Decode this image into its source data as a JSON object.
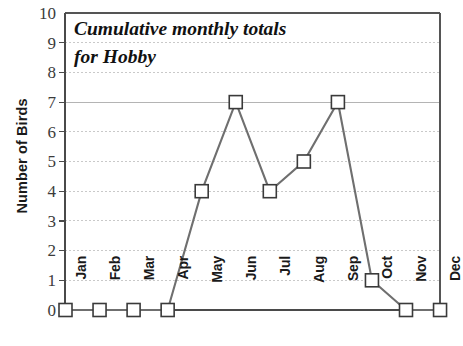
{
  "chart_data": {
    "type": "line",
    "title": "Cumulative monthly totals for Hobby",
    "title_line1": "Cumulative monthly totals",
    "title_line2": "for Hobby",
    "xlabel": "",
    "ylabel": "Number of Birds",
    "categories": [
      "Jan",
      "Feb",
      "Mar",
      "Apr",
      "May",
      "Jun",
      "Jul",
      "Aug",
      "Sep",
      "Oct",
      "Nov",
      "Dec"
    ],
    "values": [
      0,
      0,
      0,
      0,
      4,
      7,
      4,
      5,
      7,
      1,
      0,
      0
    ],
    "series": [
      {
        "name": "Hobby",
        "values": [
          0,
          0,
          0,
          0,
          4,
          7,
          4,
          5,
          7,
          1,
          0,
          0
        ]
      }
    ],
    "ylim": [
      0,
      10
    ],
    "y_ticks": [
      0,
      1,
      2,
      3,
      4,
      5,
      6,
      7,
      8,
      9,
      10
    ],
    "y_tick_labels": [
      "0",
      "1",
      "2",
      "3",
      "4",
      "5",
      "6",
      "7",
      "8",
      "9",
      "10"
    ],
    "grid": true,
    "grid_axis": "y",
    "legend": "none",
    "marker": "open-square",
    "line_color": "#6f6f6f",
    "marker_edge_color": "#3a3a3a",
    "marker_face_color": "#ffffff",
    "grid_color": "#c9c9c9",
    "axis_color": "#555555",
    "text_color": "#1a1a1a"
  }
}
